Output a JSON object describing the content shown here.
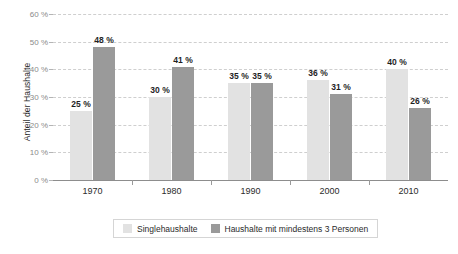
{
  "chart_data": {
    "type": "bar",
    "title": "",
    "subtitle": "",
    "xlabel": "",
    "ylabel": "Anteil der Haushalte",
    "categories": [
      "1970",
      "1980",
      "1990",
      "2000",
      "2010"
    ],
    "series": [
      {
        "name": "Singlehaushalte",
        "color": "#e2e2e2",
        "values": [
          25,
          30,
          35,
          36,
          40
        ],
        "labels": [
          "25 %",
          "30 %",
          "35 %",
          "36 %",
          "40 %"
        ]
      },
      {
        "name": "Haushalte mit mindestens 3 Personen",
        "color": "#9a9a9a",
        "values": [
          48,
          41,
          35,
          31,
          26
        ],
        "labels": [
          "48 %",
          "41 %",
          "35 %",
          "31 %",
          "26 %"
        ]
      }
    ],
    "ylim": [
      0,
      60
    ],
    "ytick_values": [
      0,
      10,
      20,
      30,
      40,
      50,
      60
    ],
    "ytick_labels": [
      "0 %",
      "10 %",
      "20 %",
      "30 %",
      "40 %",
      "50 %",
      "60 %"
    ],
    "grid": true,
    "grid_style": "dashed",
    "legend_position": "bottom"
  },
  "axis": {
    "y_title": "Anteil der Haushalte"
  },
  "legend": {
    "items": [
      {
        "label": "Singlehaushalte"
      },
      {
        "label": "Haushalte mit mindestens 3 Personen"
      }
    ]
  },
  "colors": {
    "series_light": "#e2e2e2",
    "series_dark": "#9a9a9a",
    "gridline": "#cfcfcf",
    "axis": "#8d8d8d",
    "tick_text": "#8a8a8a",
    "label_text": "#2b2b2b"
  }
}
